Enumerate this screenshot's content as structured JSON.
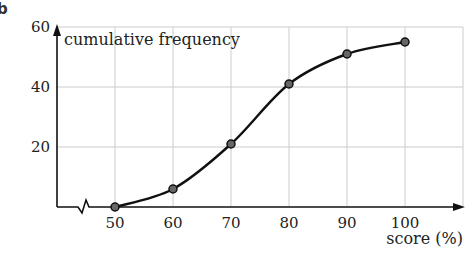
{
  "question_label": "b",
  "chart_data": {
    "type": "line",
    "title": "",
    "ylabel": "cumulative frequency",
    "xlabel": "score (%)",
    "x": [
      50,
      60,
      70,
      80,
      90,
      100
    ],
    "series": [
      {
        "name": "cumulative frequency",
        "values": [
          0,
          6,
          21,
          41,
          51,
          55
        ]
      }
    ],
    "xticks": [
      "50",
      "60",
      "70",
      "80",
      "90",
      "100"
    ],
    "yticks": [
      "20",
      "40",
      "60"
    ],
    "xlim": [
      40,
      110
    ],
    "ylim": [
      0,
      60
    ],
    "grid": true,
    "axis_break_x": true,
    "markers": true,
    "smooth": true,
    "colors": {
      "line": "#111111",
      "marker_fill": "#666666",
      "grid": "#cccccc",
      "axis": "#111111"
    }
  }
}
